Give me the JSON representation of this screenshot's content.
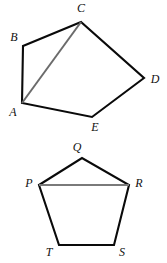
{
  "figure": {
    "background_color": "#ffffff",
    "edge_color": "#0a0a0a",
    "diagonal_color": "#6b6b6b",
    "label_color": "#111111",
    "shapes": [
      {
        "id": "pentagon-upper",
        "name": "pentagon-ABCDE",
        "vertex_order": "A,B,C,D,E",
        "closed": true,
        "points": "22,103 23,46 81,22 144,78 92,117",
        "diagonal": {
          "name": "diagonal-AC",
          "from": "A",
          "to": "C",
          "points": "22,103 81,22",
          "color": "#6b6b6b"
        },
        "labels": [
          {
            "text": "A",
            "x": 13,
            "y": 113
          },
          {
            "text": "B",
            "x": 14,
            "y": 38
          },
          {
            "text": "C",
            "x": 81,
            "y": 9
          },
          {
            "text": "D",
            "x": 155,
            "y": 80
          },
          {
            "text": "E",
            "x": 95,
            "y": 128
          }
        ]
      },
      {
        "id": "pentagon-lower",
        "name": "pentagon-PQRST",
        "vertex_order": "P,Q,R,S,T",
        "closed": true,
        "points": "39,185 82,158 129,185 114,245 59,245",
        "diagonal": {
          "name": "diagonal-PR",
          "from": "P",
          "to": "R",
          "points": "39,185 129,185",
          "color": "#7a7a7a"
        },
        "labels": [
          {
            "text": "P",
            "x": 29,
            "y": 184
          },
          {
            "text": "Q",
            "x": 77,
            "y": 148
          },
          {
            "text": "R",
            "x": 139,
            "y": 184
          },
          {
            "text": "S",
            "x": 122,
            "y": 253
          },
          {
            "text": "T",
            "x": 49,
            "y": 253
          }
        ]
      }
    ]
  }
}
